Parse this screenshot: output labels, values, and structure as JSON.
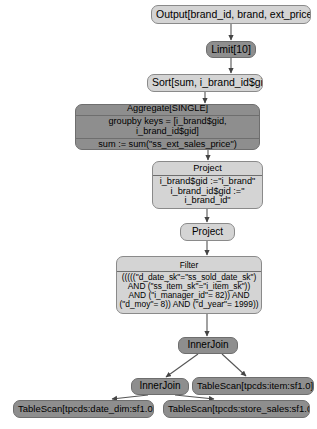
{
  "diagram": {
    "type": "query-execution-plan",
    "colors": {
      "node_light": "#d4d4d4",
      "node_dark": "#8e8e8e",
      "border": "#6e6e6e",
      "edge": "#555555",
      "background": "#ffffff",
      "text": "#000000"
    },
    "nodes": {
      "output": {
        "label": "Output[brand_id, brand, ext_price]",
        "shade": "light"
      },
      "limit": {
        "label": "Limit[10]",
        "shade": "dark"
      },
      "sort": {
        "label": "Sort[sum, i_brand_id$gid]",
        "shade": "light"
      },
      "aggregate": {
        "title": "Aggregate[SINGLE]",
        "groupby": "groupby keys = [i_brand$gid, i_brand_id$gid]",
        "sum": "sum := sum(\"ss_ext_sales_price\")",
        "shade": "dark"
      },
      "project_detail": {
        "title": "Project",
        "line1": "i_brand$gid :=\"i_brand\"",
        "line2": "i_brand_id$gid :=\"",
        "line3": "i_brand_id\"",
        "shade": "light"
      },
      "project_plain": {
        "label": "Project",
        "shade": "light"
      },
      "filter": {
        "title": "Filter",
        "predicate": "(((((\"d_date_sk\"=\"ss_sold_date_sk\") AND (\"ss_item_sk\"=\"i_item_sk\")) AND (\"i_manager_id\"= 82)) AND (\"d_moy\"= 8)) AND (\"d_year\"= 1999))",
        "shade": "light"
      },
      "innerjoin_top": {
        "label": "InnerJoin",
        "shade": "dark"
      },
      "innerjoin_lower": {
        "label": "InnerJoin",
        "shade": "dark"
      },
      "tablescan_item": {
        "label": "TableScan[tpcds:item:sf1.0]",
        "shade": "dark"
      },
      "tablescan_date_dim": {
        "label": "TableScan[tpcds:date_dim:sf1.0]",
        "shade": "dark"
      },
      "tablescan_store_sales": {
        "label": "TableScan[tpcds:store_sales:sf1.0]",
        "shade": "dark"
      }
    }
  }
}
